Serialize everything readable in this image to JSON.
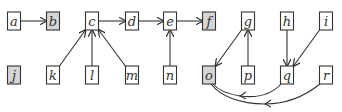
{
  "diagram": {
    "type": "directed-graph",
    "colors": {
      "node_fill": "#ffffff",
      "shaded_fill": "#d6d6d6",
      "stroke": "#333333"
    },
    "nodes": [
      {
        "id": "a",
        "label": "a",
        "x": 14,
        "y": 21,
        "shaded": false
      },
      {
        "id": "b",
        "label": "b",
        "x": 53,
        "y": 21,
        "shaded": true
      },
      {
        "id": "c",
        "label": "c",
        "x": 92,
        "y": 21,
        "shaded": false
      },
      {
        "id": "d",
        "label": "d",
        "x": 132,
        "y": 21,
        "shaded": false
      },
      {
        "id": "e",
        "label": "e",
        "x": 170,
        "y": 21,
        "shaded": false
      },
      {
        "id": "f",
        "label": "f",
        "x": 209,
        "y": 21,
        "shaded": true
      },
      {
        "id": "g",
        "label": "g",
        "x": 248,
        "y": 21,
        "shaded": false
      },
      {
        "id": "h",
        "label": "h",
        "x": 287,
        "y": 21,
        "shaded": false
      },
      {
        "id": "i",
        "label": "i",
        "x": 326,
        "y": 21,
        "shaded": false
      },
      {
        "id": "j",
        "label": "j",
        "x": 14,
        "y": 75,
        "shaded": true
      },
      {
        "id": "k",
        "label": "k",
        "x": 53,
        "y": 75,
        "shaded": false
      },
      {
        "id": "l",
        "label": "l",
        "x": 92,
        "y": 75,
        "shaded": false
      },
      {
        "id": "m",
        "label": "m",
        "x": 132,
        "y": 75,
        "shaded": false
      },
      {
        "id": "n",
        "label": "n",
        "x": 170,
        "y": 75,
        "shaded": false
      },
      {
        "id": "o",
        "label": "o",
        "x": 209,
        "y": 75,
        "shaded": true
      },
      {
        "id": "p",
        "label": "p",
        "x": 248,
        "y": 75,
        "shaded": false
      },
      {
        "id": "q",
        "label": "q",
        "x": 287,
        "y": 75,
        "shaded": false
      },
      {
        "id": "r",
        "label": "r",
        "x": 326,
        "y": 75,
        "shaded": false
      }
    ],
    "edges": [
      {
        "from": "a",
        "to": "b"
      },
      {
        "from": "c",
        "to": "d"
      },
      {
        "from": "d",
        "to": "e"
      },
      {
        "from": "e",
        "to": "f"
      },
      {
        "from": "k",
        "to": "c"
      },
      {
        "from": "l",
        "to": "c"
      },
      {
        "from": "m",
        "to": "c"
      },
      {
        "from": "n",
        "to": "e"
      },
      {
        "from": "g",
        "to": "o"
      },
      {
        "from": "p",
        "to": "g"
      },
      {
        "from": "h",
        "to": "q"
      },
      {
        "from": "i",
        "to": "q"
      },
      {
        "from": "q",
        "to": "o",
        "curved": true
      },
      {
        "from": "r",
        "to": "o",
        "curved": true
      }
    ]
  }
}
